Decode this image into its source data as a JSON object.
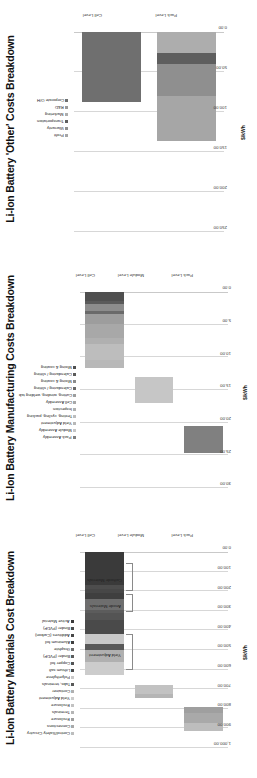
{
  "page": {
    "background": "#ffffff",
    "orientation": "charts rotated 90 degrees counter-clockwise"
  },
  "charts": [
    {
      "id": "other-costs",
      "title": "Li-Ion Battery 'Other' Costs Breakdown",
      "axis_title": "$/kWh",
      "ticks": [
        "250.00",
        "200.00",
        "150.00",
        "100.00",
        "50.00",
        "0.00"
      ],
      "categories": [
        "Cell Level",
        "Pack Level"
      ],
      "legend": [
        {
          "label": "Profit",
          "color": "#a6a6a6"
        },
        {
          "label": "Warranty",
          "color": "#8f8f8f"
        },
        {
          "label": "Transportation",
          "color": "#5e5e5e"
        },
        {
          "label": "Marketing",
          "color": "#adadad"
        },
        {
          "label": "R&D",
          "color": "#9a9a9a"
        },
        {
          "label": "Corporate O/H",
          "color": "#6f6f6f"
        }
      ]
    },
    {
      "id": "manufacturing-costs",
      "title": "Li-Ion Battery Manufacturing Costs Breakdown",
      "axis_title": "$/kWh",
      "ticks": [
        "30.00",
        "25.00",
        "20.00",
        "15.00",
        "10.00",
        "5.00",
        "0.00"
      ],
      "categories": [
        "Cell Level",
        "Module Level",
        "Pack Level"
      ],
      "legend": [
        {
          "label": "Pack Assembly",
          "color": "#808080"
        },
        {
          "label": "Module Assembly",
          "color": "#c6c6c6"
        },
        {
          "label": "Yield Adjustment",
          "color": "#b8b8b8"
        },
        {
          "label": "Testing, cycling, packing",
          "color": "#bdbdbd"
        },
        {
          "label": "Inspection",
          "color": "#b0b0b0"
        },
        {
          "label": "Cell Assembly",
          "color": "#a8a8a8"
        },
        {
          "label": "Cutting, winding, welding tab",
          "color": "#9d9d9d"
        },
        {
          "label": "Calendaring / slitting",
          "color": "#6a6a6a"
        },
        {
          "label": "Mixing & coating",
          "color": "#8c8c8c"
        },
        {
          "label": "Calendaring / slitting",
          "color": "#5a5a5a"
        },
        {
          "label": "Mixing & coating",
          "color": "#4f4f4f"
        }
      ]
    },
    {
      "id": "materials-costs",
      "title": "Li-Ion Battery Materials Cost Breakdown",
      "axis_title": "$/kWh",
      "ticks": [
        "1,000.00",
        "900.00",
        "800.00",
        "700.00",
        "600.00",
        "500.00",
        "400.00",
        "300.00",
        "200.00",
        "100.00",
        "0.00"
      ],
      "categories": [
        "Cell Level",
        "Module Level",
        "Pack Level"
      ],
      "annotations": [
        "Yield Adjustment",
        "Anode Materials",
        "Cathode Materials"
      ],
      "legend": [
        {
          "label": "Control/Safety Circuitry",
          "color": "#bdbdbd"
        },
        {
          "label": "Connections",
          "color": "#a9a9a9"
        },
        {
          "label": "Enclosure",
          "color": "#9f9f9f"
        },
        {
          "label": "Terminals",
          "color": "#b5b5b5"
        },
        {
          "label": "Enclosure",
          "color": "#c2c2c2"
        },
        {
          "label": "Yield Adjustment",
          "color": "#cccccc"
        },
        {
          "label": "Container",
          "color": "#b0b0b0"
        },
        {
          "label": "Tabs, terminals",
          "color": "#585858"
        },
        {
          "label": "Polyethylene",
          "color": "#c8c8c8"
        },
        {
          "label": "Lithium salt",
          "color": "#4a4a4a"
        },
        {
          "label": "Copper foil",
          "color": "#545454"
        },
        {
          "label": "Binder (PVDF)",
          "color": "#5c5c5c"
        },
        {
          "label": "Graphite",
          "color": "#6e6e6e"
        },
        {
          "label": "Aluminum foil",
          "color": "#3f3f3f"
        },
        {
          "label": "Additives (Carbon)",
          "color": "#474747"
        },
        {
          "label": "Binder (PVDF)",
          "color": "#4d4d4d"
        },
        {
          "label": "Active Material",
          "color": "#3a3a3a"
        }
      ]
    }
  ],
  "chart_data": [
    {
      "type": "bar",
      "id": "other-costs",
      "orientation": "horizontal-stacked",
      "title": "Li-Ion Battery 'Other' Costs Breakdown",
      "xlabel": "",
      "ylabel": "$/kWh",
      "ylim": [
        0,
        250
      ],
      "grid": true,
      "legend_position": "top",
      "categories": [
        "Cell Level",
        "Pack Level"
      ],
      "series": [
        {
          "name": "Profit",
          "values": [
            0,
            56
          ]
        },
        {
          "name": "Warranty",
          "values": [
            0,
            40
          ]
        },
        {
          "name": "Transportation",
          "values": [
            0,
            14
          ]
        },
        {
          "name": "Marketing",
          "values": [
            0,
            26
          ]
        },
        {
          "name": "R&D",
          "values": [
            0,
            0
          ]
        },
        {
          "name": "Corporate O/H",
          "values": [
            88,
            0
          ]
        }
      ],
      "totals": {
        "Cell Level": 88,
        "Pack Level": 236
      }
    },
    {
      "type": "bar",
      "id": "manufacturing-costs",
      "orientation": "horizontal-stacked",
      "title": "Li-Ion Battery Manufacturing Costs Breakdown",
      "xlabel": "",
      "ylabel": "$/kWh",
      "ylim": [
        0,
        30
      ],
      "grid": true,
      "legend_position": "top",
      "categories": [
        "Cell Level",
        "Module Level",
        "Pack Level"
      ],
      "series": [
        {
          "name": "Pack Assembly",
          "values": [
            0,
            0,
            4.2
          ]
        },
        {
          "name": "Module Assembly",
          "values": [
            0,
            4.0,
            0
          ]
        },
        {
          "name": "Yield Adjustment",
          "values": [
            1.2,
            0,
            0
          ]
        },
        {
          "name": "Testing, cycling, packing",
          "values": [
            2.4,
            0,
            0
          ]
        },
        {
          "name": "Inspection",
          "values": [
            0.9,
            0,
            0
          ]
        },
        {
          "name": "Cell Assembly",
          "values": [
            2.2,
            0,
            0
          ]
        },
        {
          "name": "Cutting, winding, welding tab",
          "values": [
            1.6,
            0,
            0
          ]
        },
        {
          "name": "Calendaring / slitting",
          "values": [
            0.4,
            0,
            0
          ]
        },
        {
          "name": "Mixing & coating",
          "values": [
            1.1,
            0,
            0
          ]
        },
        {
          "name": "Calendaring / slitting",
          "values": [
            0.5,
            0,
            0
          ]
        },
        {
          "name": "Mixing & coating",
          "values": [
            1.3,
            0,
            0
          ]
        }
      ],
      "totals": {
        "Cell Level": 11.6,
        "Module Level": 4.0,
        "Pack Level": 4.2
      },
      "bar_ranges": {
        "Cell Level": [
          0,
          11.6
        ],
        "Module Level": [
          13.0,
          17.0
        ],
        "Pack Level": [
          20.5,
          24.7
        ]
      }
    },
    {
      "type": "bar",
      "id": "materials-costs",
      "orientation": "horizontal-stacked",
      "title": "Li-Ion Battery Materials Cost Breakdown",
      "xlabel": "",
      "ylabel": "$/kWh",
      "ylim": [
        0,
        1000
      ],
      "grid": true,
      "legend_position": "top",
      "categories": [
        "Cell Level",
        "Module Level",
        "Pack Level"
      ],
      "series": [
        {
          "name": "Control/Safety Circuitry",
          "values": [
            0,
            0,
            40
          ]
        },
        {
          "name": "Connections",
          "values": [
            0,
            0,
            55
          ]
        },
        {
          "name": "Enclosure",
          "values": [
            0,
            0,
            30
          ]
        },
        {
          "name": "Terminals",
          "values": [
            0,
            20,
            0
          ]
        },
        {
          "name": "Enclosure",
          "values": [
            0,
            45,
            0
          ]
        },
        {
          "name": "Yield Adjustment",
          "values": [
            70,
            0,
            0
          ]
        },
        {
          "name": "Container",
          "values": [
            60,
            0,
            0
          ]
        },
        {
          "name": "Tabs, terminals",
          "values": [
            30,
            0,
            0
          ]
        },
        {
          "name": "Polyethylene",
          "values": [
            50,
            0,
            0
          ]
        },
        {
          "name": "Lithium salt",
          "values": [
            75,
            0,
            0
          ]
        },
        {
          "name": "Copper foil",
          "values": [
            35,
            0,
            0
          ]
        },
        {
          "name": "Binder (PVDF)",
          "values": [
            15,
            0,
            0
          ]
        },
        {
          "name": "Graphite",
          "values": [
            55,
            0,
            0
          ]
        },
        {
          "name": "Aluminum foil",
          "values": [
            30,
            0,
            0
          ]
        },
        {
          "name": "Additives (Carbon)",
          "values": [
            20,
            0,
            0
          ]
        },
        {
          "name": "Binder (PVDF)",
          "values": [
            20,
            0,
            0
          ]
        },
        {
          "name": "Active Material",
          "values": [
            170,
            0,
            0
          ]
        }
      ],
      "totals": {
        "Cell Level": 630,
        "Module Level": 65,
        "Pack Level": 125
      },
      "bar_ranges": {
        "Cell Level": [
          0,
          630
        ],
        "Module Level": [
          680,
          745
        ],
        "Pack Level": [
          790,
          915
        ]
      }
    }
  ]
}
